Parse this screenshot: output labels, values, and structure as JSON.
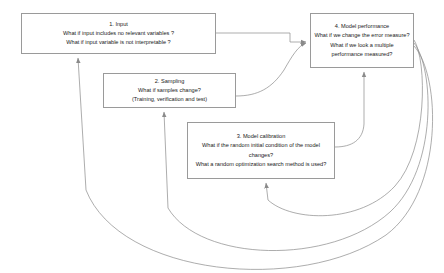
{
  "diagram": {
    "type": "flow-diagram",
    "title": "",
    "line_color": "#8a8a8a",
    "box_border_color": "#9a9a9a",
    "background_color": "#ffffff",
    "text_color": "#1a1a1a",
    "nodes": [
      {
        "id": "input",
        "title": "1. Input",
        "lines": [
          "What if input includes no relevant variables ?",
          "What if input variable is not interpretable ?"
        ]
      },
      {
        "id": "sampling",
        "title": "2. Sampling",
        "lines": [
          "What if samples change?",
          "(Training, verification and test)"
        ]
      },
      {
        "id": "calibration",
        "title": "3. Model calibration",
        "lines": [
          "What if the random initial condition of the model changes?",
          "What a random optimization search method is used?"
        ]
      },
      {
        "id": "performance",
        "title": "4. Model performance",
        "lines": [
          "What if we change the error measure?",
          "What if we look a multiple performance measured?"
        ]
      }
    ],
    "edges": [
      {
        "from": "input",
        "to": "performance",
        "style": "orthogonal"
      },
      {
        "from": "sampling",
        "to": "performance",
        "style": "curve"
      },
      {
        "from": "calibration",
        "to": "performance",
        "style": "curve"
      },
      {
        "from": "performance",
        "to": "calibration",
        "style": "feedback-arc"
      },
      {
        "from": "performance",
        "to": "sampling",
        "style": "feedback-arc"
      },
      {
        "from": "performance",
        "to": "input",
        "style": "feedback-arc"
      }
    ]
  }
}
